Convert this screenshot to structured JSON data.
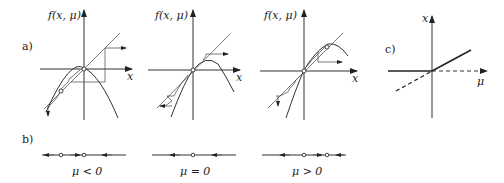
{
  "figure": {
    "panel_labels": {
      "a": "a)",
      "b": "b)",
      "c": "c)"
    },
    "panel_a": {
      "y_axis_label": "f(x, μ)",
      "x_axis_label": "x",
      "subplots": [
        {
          "name": "mu-negative",
          "y_label": "f(x, μ)",
          "x_label": "x"
        },
        {
          "name": "mu-zero",
          "y_label": "f(x, μ)",
          "x_label": "x"
        },
        {
          "name": "mu-positive",
          "y_label": "f(x, μ)",
          "x_label": "x"
        }
      ]
    },
    "panel_b": {
      "lines": [
        {
          "caption": "μ < 0",
          "fixed_points": 2
        },
        {
          "caption": "μ = 0",
          "fixed_points": 1
        },
        {
          "caption": "μ > 0",
          "fixed_points": 2
        }
      ]
    },
    "panel_c": {
      "y_axis_label": "x",
      "x_axis_label": "μ"
    }
  }
}
